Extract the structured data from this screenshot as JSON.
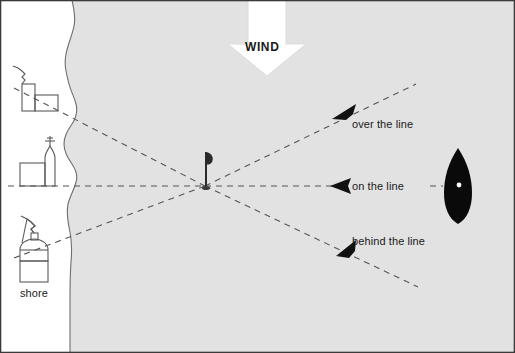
{
  "diagram": {
    "type": "sailing-race-start-diagram",
    "canvas": {
      "width": 515,
      "height": 353
    },
    "colors": {
      "water": "#e2e2e2",
      "land": "#ffffff",
      "shoreline": "#6e6e6e",
      "dashed_line": "#555555",
      "arrowhead": "#111111",
      "boat_hull": "#0a0a0a",
      "boat_mark": "#ffffff",
      "wind_arrow_fill": "#ffffff",
      "wind_arrow_stroke": "#d8d8d8",
      "text": "#1a1a1a",
      "border": "#3a3a3a",
      "icon_stroke": "#5a5a5a"
    },
    "labels": {
      "wind": "WIND",
      "over_the_line": "over the line",
      "on_the_line": "on the line",
      "behind_the_line": "behind the line",
      "shore": "shore"
    },
    "regions": [
      {
        "name": "land",
        "side": "left",
        "fill": "#ffffff"
      },
      {
        "name": "water",
        "side": "right",
        "fill": "#e2e2e2"
      }
    ],
    "mark": {
      "name": "committee-mast",
      "x": 205,
      "y": 186,
      "description": "race mark mast with pennant"
    },
    "boat": {
      "name": "sailing-boat",
      "x": 458,
      "y": 186,
      "heading": "north",
      "hull_color": "#0a0a0a"
    },
    "wind_arrow": {
      "direction": "down",
      "tip_x": 267,
      "tip_y": 74,
      "tail_y": 0
    },
    "shore_icons": [
      {
        "name": "shore-building-house",
        "x": 14,
        "y": 70,
        "label": ""
      },
      {
        "name": "shore-building-tower",
        "x": 16,
        "y": 146,
        "label": ""
      },
      {
        "name": "shore-building-tank",
        "x": 16,
        "y": 238,
        "label": "shore"
      }
    ],
    "sight_lines": [
      {
        "name": "over-the-line",
        "from": [
          205,
          186
        ],
        "to": [
          415,
          84
        ],
        "arrow_at": [
          342,
          115
        ],
        "label": "over the line",
        "shore_target": [
          14,
          88
        ]
      },
      {
        "name": "on-the-line",
        "from": [
          205,
          186
        ],
        "to": [
          508,
          186
        ],
        "arrow_at": [
          338,
          186
        ],
        "label": "on the line",
        "shore_target": [
          14,
          186
        ]
      },
      {
        "name": "behind-the-line",
        "from": [
          205,
          186
        ],
        "to": [
          415,
          285
        ],
        "arrow_at": [
          344,
          252
        ],
        "label": "behind the line",
        "shore_target": [
          14,
          256
        ]
      }
    ]
  }
}
